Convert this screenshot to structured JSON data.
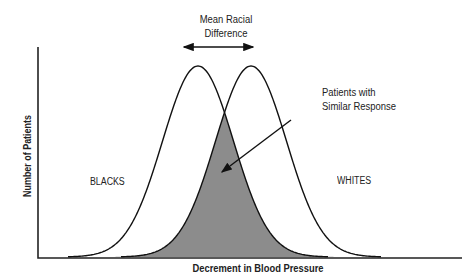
{
  "chart_data": {
    "type": "area",
    "title": "Mean Racial Difference",
    "xlabel": "Decrement in Blood Pressure",
    "ylabel": "Number of Patients",
    "grid": false,
    "series": [
      {
        "name": "BLACKS",
        "distribution": "normal",
        "relative_mean": 0,
        "relative_sd": 1
      },
      {
        "name": "WHITES",
        "distribution": "normal",
        "relative_mean": 1.5,
        "relative_sd": 1
      }
    ],
    "annotations": [
      {
        "text": "Mean Racial Difference",
        "type": "double-arrow between curve peaks"
      },
      {
        "text": "Patients with Similar Response",
        "type": "arrow pointing to shaded overlap region"
      }
    ],
    "colors": {
      "overlap_fill": "#8c8c8c",
      "lines": "#111111"
    }
  },
  "labels": {
    "title_line1": "Mean Racial",
    "title_line2": "Difference",
    "callout_line1": "Patients with",
    "callout_line2": "Similar Response",
    "series_left": "BLACKS",
    "series_right": "WHITES",
    "x_axis": "Decrement in Blood Pressure",
    "y_axis": "Number of Patients"
  }
}
